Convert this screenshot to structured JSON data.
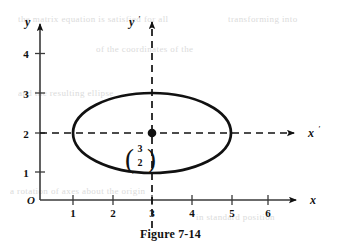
{
  "figure": {
    "caption": "Figure 7-14",
    "origin_label": "O"
  },
  "axes": {
    "y_label": "y",
    "x_label": "x",
    "y_prime_label": "y",
    "x_prime_label": "x",
    "prime_mark": "′",
    "y_ticks": [
      "4",
      "3",
      "2",
      "1"
    ],
    "x_ticks": [
      "1",
      "2",
      "3",
      "4",
      "5",
      "6"
    ]
  },
  "annotation": {
    "vector_top": "3",
    "vector_bottom": "2",
    "paren_left": "(",
    "paren_right": ")"
  },
  "colors": {
    "ink": "#111111",
    "axis": "#3a3a3a",
    "ghost": "#cfcfcf"
  },
  "ghost_text": [
    {
      "text": "the matrix equation is satisfied for all",
      "x": 18,
      "y": 14
    },
    {
      "text": "transforming into",
      "x": 228,
      "y": 14
    },
    {
      "text": "of the coordinates of the",
      "x": 96,
      "y": 44
    },
    {
      "text": "and the resulting ellipse",
      "x": 18,
      "y": 88
    },
    {
      "text": "a rotation of axes about the origin",
      "x": 10,
      "y": 186
    },
    {
      "text": "in standard position",
      "x": 196,
      "y": 212
    }
  ],
  "chart_data": {
    "type": "scatter",
    "title": "Figure 7-14",
    "xlabel": "x",
    "ylabel": "y",
    "xlim": [
      0,
      6.8
    ],
    "ylim": [
      0,
      4.6
    ],
    "grid": false,
    "legend": null,
    "x_tick_values": [
      1,
      2,
      3,
      4,
      5,
      6
    ],
    "y_tick_values": [
      1,
      2,
      3,
      4
    ],
    "shapes": [
      {
        "kind": "ellipse",
        "center": [
          3,
          2
        ],
        "semi_axis_x": 2,
        "semi_axis_y": 1,
        "x_range": [
          1,
          5
        ],
        "y_range": [
          1,
          3
        ],
        "stroke": "#111111",
        "fill": "none"
      }
    ],
    "points": [
      {
        "x": 3,
        "y": 2,
        "label": "(3, 2)",
        "marker": "filled-circle"
      }
    ],
    "translated_axes": [
      {
        "name": "x'",
        "type": "horizontal",
        "at_y": 2,
        "style": "dashed",
        "arrow": "right"
      },
      {
        "name": "y'",
        "type": "vertical",
        "at_x": 3,
        "style": "dashed",
        "arrow": "up"
      }
    ]
  }
}
